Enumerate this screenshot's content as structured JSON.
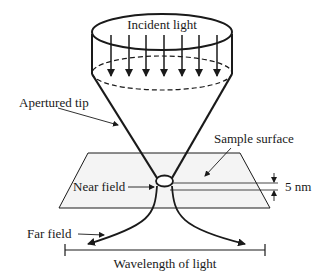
{
  "diagram": {
    "type": "NSOM apertured probe schematic",
    "labels": {
      "incident_light": "Incident light",
      "apertured_tip": "Apertured tip",
      "sample_surface": "Sample surface",
      "near_field": "Near field",
      "thickness": "5 nm",
      "far_field": "Far field",
      "wavelength": "Wavelength of light"
    },
    "arrow_count": 7,
    "colors": {
      "stroke": "#1a1a1a",
      "plane_fill": "#f4f4f4",
      "background": "#ffffff"
    }
  }
}
